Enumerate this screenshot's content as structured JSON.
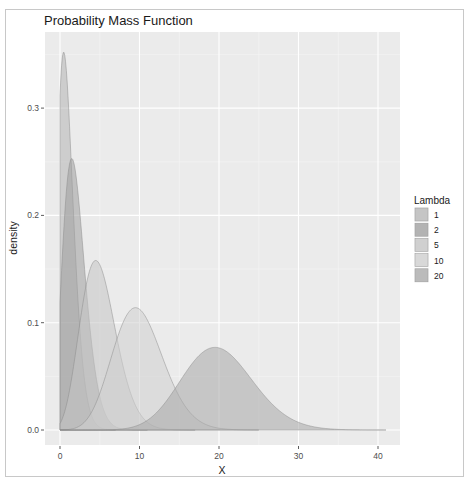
{
  "chart_data": {
    "type": "area",
    "title": "Probability Mass Function",
    "xlabel": "X",
    "ylabel": "density",
    "xlim": [
      -2,
      43
    ],
    "ylim": [
      0,
      0.36
    ],
    "x_ticks": [
      0,
      10,
      20,
      30,
      40
    ],
    "y_ticks": [
      0.0,
      0.1,
      0.2,
      0.3
    ],
    "y_tick_labels": [
      "0.0",
      "0.1",
      "0.2",
      "0.3"
    ],
    "grid": true,
    "legend_position": "right",
    "legend_title": "Lambda",
    "series": [
      {
        "name": "1",
        "lambda": 1,
        "peak_x": 0.6,
        "peak_density": 0.352,
        "end_x": 7,
        "fill": "#b5b5b5"
      },
      {
        "name": "2",
        "lambda": 2,
        "peak_x": 1.6,
        "peak_density": 0.253,
        "end_x": 11,
        "fill": "#9e9e9e"
      },
      {
        "name": "5",
        "lambda": 5,
        "peak_x": 4.6,
        "peak_density": 0.158,
        "end_x": 17,
        "fill": "#c4c4c4"
      },
      {
        "name": "10",
        "lambda": 10,
        "peak_x": 9.7,
        "peak_density": 0.114,
        "end_x": 25,
        "fill": "#cfcfcf"
      },
      {
        "name": "20",
        "lambda": 20,
        "peak_x": 19.8,
        "peak_density": 0.077,
        "end_x": 41,
        "fill": "#a8a8a8"
      }
    ]
  },
  "legend": {
    "title": "Lambda",
    "items": [
      "1",
      "2",
      "5",
      "10",
      "20"
    ]
  }
}
